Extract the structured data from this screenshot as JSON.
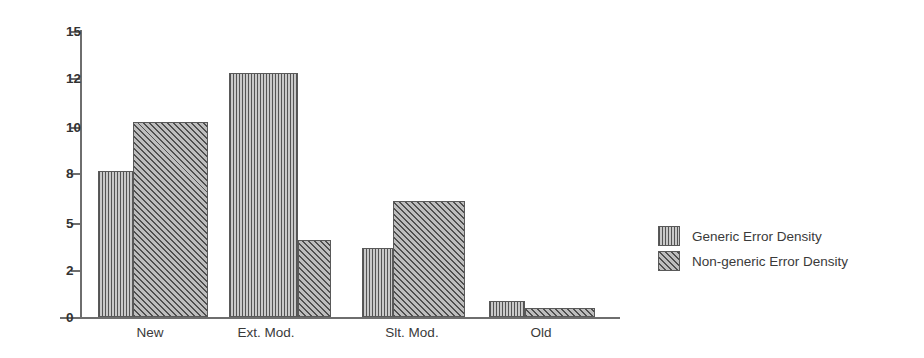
{
  "chart_data": {
    "type": "bar",
    "title": "",
    "xlabel": "",
    "ylabel": "",
    "categories": [
      "New",
      "Ext. Mod.",
      "Slt. Mod.",
      "Old"
    ],
    "series": [
      {
        "name": "Generic Error Density",
        "pattern": "vertical-stripes",
        "values": [
          8.1,
          12.3,
          3.4,
          0.7
        ]
      },
      {
        "name": "Non-generic Error Density",
        "pattern": "diagonal-hatch",
        "values": [
          10.2,
          3.9,
          6.3,
          0.4
        ]
      }
    ],
    "ytick_labels": [
      "15",
      "12",
      "10",
      "8",
      "5",
      "2",
      "0"
    ],
    "ytick_values": [
      15,
      12,
      10,
      8,
      5,
      2,
      0
    ],
    "ylim": [
      0,
      15
    ],
    "yaxis_scale": "categorical-even-spacing",
    "grid": false,
    "legend_position": "right",
    "legend_entries": [
      "Generic Error Density",
      "Non-generic Error Density"
    ],
    "colors": {
      "axis": "#6e6e6e",
      "bar_outline": "#595959",
      "series_1_fill": "#8d8d8d",
      "series_2_fill": "#8a8a8a",
      "text": "#3a3a3a",
      "background": "#ffffff"
    }
  }
}
